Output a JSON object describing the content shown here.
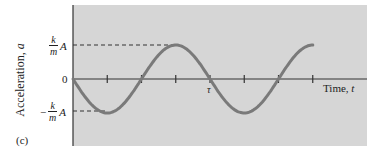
{
  "chart_data": {
    "type": "line",
    "title": "",
    "panel_label": "(c)",
    "xlabel": "Time, t",
    "ylabel": "Acceleration, a",
    "y_tick_labels": [
      "k/m A",
      "0",
      "-k/m A"
    ],
    "y_ticks": [
      1,
      0,
      -1
    ],
    "x_tick_labels": [
      {
        "position": 1.0,
        "label": "τ"
      }
    ],
    "x_ticks_in_periods": [
      0,
      0.25,
      0.5,
      0.75,
      1.0,
      1.25,
      1.5,
      1.75
    ],
    "x_range_periods": [
      0,
      1.75
    ],
    "ylim": [
      -1,
      1
    ],
    "grid": false,
    "reference_lines": [
      {
        "y": 1,
        "style": "dashed",
        "label": "k/m A"
      },
      {
        "y": -1,
        "style": "dashed",
        "label": "-k/m A"
      }
    ],
    "series": [
      {
        "name": "a(t) = -(k/m) A sin(2πt/τ)",
        "x": [
          0,
          0.25,
          0.5,
          0.75,
          1.0,
          1.25,
          1.5,
          1.75
        ],
        "values": [
          0,
          -1,
          0,
          1,
          0,
          -1,
          0,
          1
        ]
      }
    ],
    "colors": {
      "background": "#d6d6d6",
      "curve": "#7a7a7a",
      "axis": "#333333"
    }
  },
  "labels": {
    "panel": "(c)",
    "ylabel": "Acceleration, ",
    "ylabel_var": "a",
    "xlabel": "Time, ",
    "xlabel_var": "t",
    "zero": "0",
    "k": "k",
    "m": "m",
    "A": "A",
    "minus": "−",
    "tau": "τ"
  }
}
